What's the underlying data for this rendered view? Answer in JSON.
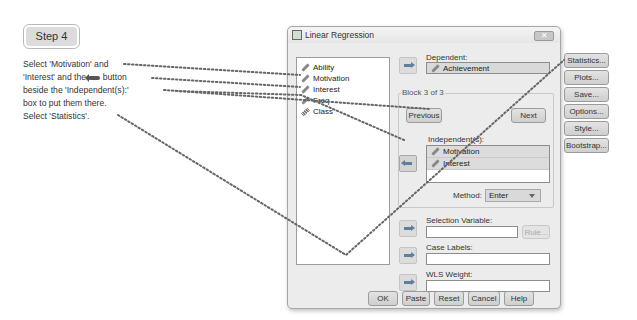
{
  "step": {
    "label": "Step 4"
  },
  "instructions": {
    "line1": "Select 'Motivation' and",
    "line2a": "'Interest' and the",
    "line2b": "button",
    "line3": "beside the 'Independent(s):'",
    "line4": "box to put them there.",
    "line5": "Select 'Statistics'."
  },
  "dialog": {
    "title": "Linear Regression",
    "close_label": "✕",
    "variables": [
      {
        "name": "Ability",
        "icon": "scale-icon"
      },
      {
        "name": "Motivation",
        "icon": "scale-icon"
      },
      {
        "name": "Interest",
        "icon": "scale-icon"
      },
      {
        "name": "Freq",
        "icon": "scale-icon"
      },
      {
        "name": "Class",
        "icon": "ordinal-icon"
      }
    ],
    "dependent": {
      "label": "Dependent:",
      "value": "Achievement"
    },
    "block": {
      "legend": "Block 3 of 3",
      "previous_label": "Previous",
      "next_label": "Next",
      "independents_label": "Independent(s):",
      "independents": [
        "Motivation",
        "Interest"
      ],
      "method_label": "Method:",
      "method_value": "Enter"
    },
    "selection_variable": {
      "label": "Selection Variable:",
      "value": "",
      "rule_label": "Rule..."
    },
    "case_labels": {
      "label": "Case Labels:",
      "value": ""
    },
    "wls_weight": {
      "label": "WLS Weight:",
      "value": ""
    },
    "side_buttons": [
      "Statistics...",
      "Plots...",
      "Save...",
      "Options...",
      "Style...",
      "Bootstrap..."
    ],
    "bottom_buttons": [
      "OK",
      "Paste",
      "Reset",
      "Cancel",
      "Help"
    ]
  }
}
